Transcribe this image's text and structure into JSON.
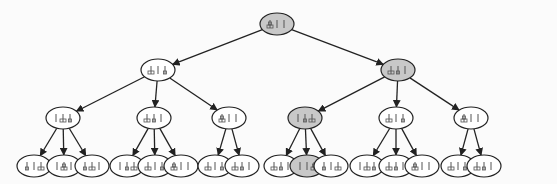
{
  "diagram": {
    "title": "",
    "colors": {
      "background": "#fbfbfb",
      "node_fill": "#ffffff",
      "node_highlight_fill": "#c8c8c8",
      "node_stroke": "#222222",
      "edge": "#222222",
      "glyph": "#555555"
    },
    "nodes": [
      {
        "id": "n0",
        "x": 272,
        "y": 23,
        "highlight": true,
        "pegs": [
          "LS",
          "",
          ""
        ]
      },
      {
        "id": "n1",
        "x": 154,
        "y": 70,
        "highlight": false,
        "pegs": [
          "L",
          "",
          "S"
        ]
      },
      {
        "id": "n2",
        "x": 397,
        "y": 70,
        "highlight": true,
        "pegs": [
          "L",
          "S",
          ""
        ]
      },
      {
        "id": "n3",
        "x": 63,
        "y": 117,
        "highlight": false,
        "pegs": [
          "",
          "L",
          "S"
        ]
      },
      {
        "id": "n4",
        "x": 154,
        "y": 117,
        "highlight": false,
        "pegs": [
          "L",
          "S",
          ""
        ]
      },
      {
        "id": "n5",
        "x": 229,
        "y": 117,
        "highlight": false,
        "pegs": [
          "LS",
          "",
          ""
        ]
      },
      {
        "id": "n6",
        "x": 305,
        "y": 117,
        "highlight": true,
        "pegs": [
          "",
          "S",
          "L"
        ]
      },
      {
        "id": "n7",
        "x": 397,
        "y": 117,
        "highlight": false,
        "pegs": [
          "L",
          "",
          "S"
        ]
      },
      {
        "id": "n8",
        "x": 472,
        "y": 117,
        "highlight": false,
        "pegs": [
          "LS",
          "",
          ""
        ]
      },
      {
        "id": "n9",
        "x": 24,
        "y": 164,
        "highlight": false,
        "pegs": [
          "S",
          "",
          "L"
        ]
      },
      {
        "id": "n10",
        "x": 63,
        "y": 164,
        "highlight": false,
        "pegs": [
          "",
          "LS",
          ""
        ]
      },
      {
        "id": "n11",
        "x": 101,
        "y": 164,
        "highlight": false,
        "pegs": [
          "S",
          "L",
          ""
        ]
      },
      {
        "id": "n12",
        "x": 140,
        "y": 164,
        "highlight": false,
        "pegs": [
          "",
          "S",
          "L"
        ]
      },
      {
        "id": "n13",
        "x": 178,
        "y": 164,
        "highlight": false,
        "pegs": [
          "L",
          "",
          "S"
        ]
      },
      {
        "id": "n14",
        "x": 216,
        "y": 164,
        "highlight": false,
        "pegs": [
          "LS",
          "",
          ""
        ]
      },
      {
        "id": "n15",
        "x": 254,
        "y": 164,
        "highlight": false,
        "pegs": [
          "L",
          "",
          "S"
        ]
      },
      {
        "id": "n16",
        "x": 292,
        "y": 164,
        "highlight": false,
        "pegs": [
          "L",
          "S",
          ""
        ]
      },
      {
        "id": "n17",
        "x": 330,
        "y": 164,
        "highlight": false,
        "pegs": [
          "L",
          "S",
          ""
        ]
      },
      {
        "id": "n18",
        "x": 368,
        "y": 164,
        "highlight": true,
        "pegs": [
          "",
          "",
          "LS"
        ]
      },
      {
        "id": "n19",
        "x": 406,
        "y": 164,
        "highlight": false,
        "pegs": [
          "S",
          "",
          "L"
        ]
      },
      {
        "id": "n20",
        "x": 444,
        "y": 164,
        "highlight": false,
        "pegs": [
          "",
          "L",
          "S"
        ]
      },
      {
        "id": "n21",
        "x": 482,
        "y": 164,
        "highlight": false,
        "pegs": [
          "L",
          "S",
          ""
        ]
      },
      {
        "id": "n22",
        "x": 520,
        "y": 164,
        "highlight": false,
        "pegs": [
          "LS",
          "",
          ""
        ]
      },
      {
        "id": "n23",
        "x": 498,
        "y": 164,
        "highlight": false,
        "pegs": [
          "L",
          "",
          "S"
        ]
      },
      {
        "id": "n24",
        "x": 536,
        "y": 164,
        "highlight": false,
        "pegs": [
          "L",
          "S",
          ""
        ]
      }
    ],
    "edges": [
      [
        "n0",
        "n1"
      ],
      [
        "n0",
        "n2"
      ],
      [
        "n1",
        "n3"
      ],
      [
        "n1",
        "n4"
      ],
      [
        "n1",
        "n5"
      ],
      [
        "n2",
        "n6"
      ],
      [
        "n2",
        "n7"
      ],
      [
        "n2",
        "n8"
      ],
      [
        "n3",
        "n9"
      ],
      [
        "n3",
        "n10"
      ],
      [
        "n3",
        "n11"
      ],
      [
        "n4",
        "n12"
      ],
      [
        "n4",
        "n13"
      ],
      [
        "n4",
        "n14"
      ],
      [
        "n5",
        "n15"
      ],
      [
        "n5",
        "n16"
      ],
      [
        "n6",
        "n17"
      ],
      [
        "n6",
        "n18"
      ],
      [
        "n6",
        "n19"
      ],
      [
        "n7",
        "n20"
      ],
      [
        "n7",
        "n21"
      ],
      [
        "n7",
        "n22"
      ],
      [
        "n8",
        "n23"
      ],
      [
        "n8",
        "n24"
      ]
    ]
  }
}
